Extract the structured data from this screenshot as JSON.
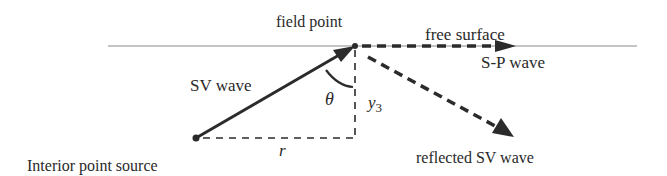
{
  "diagram": {
    "labels": {
      "field_point": "field point",
      "free_surface": "free surface",
      "sp_wave": "S-P wave",
      "sv_wave": "SV wave",
      "theta": "θ",
      "y3_base": "y",
      "y3_sub": "3",
      "r": "r",
      "source": "Interior point source",
      "reflected": "reflected SV wave"
    },
    "colors": {
      "line": "#2b2b2b",
      "surface": "#8a8a8a",
      "background": "#ffffff"
    }
  }
}
